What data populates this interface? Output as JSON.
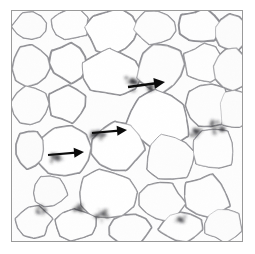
{
  "figure": {
    "kind": "histology-micrograph",
    "tissue": "adipose tissue",
    "stain_background": "#fdfdfd",
    "membrane_color": "#8d8d92",
    "membrane_dark_color": "#2f2f33",
    "frame_color": "#9a9a9a",
    "page_background": "#ffffff",
    "arrow_color": "#0b0b0b",
    "frame": {
      "x": 11,
      "y": 10,
      "width": 232,
      "height": 232
    }
  },
  "annotations": {
    "arrows": [
      {
        "name": "arrow-crown-structure-upper-right",
        "label": "",
        "direction": "right",
        "tail_x": 128,
        "tail_y": 87,
        "tip_x": 165,
        "tip_y": 82,
        "length": 38,
        "stroke_width": 2.4,
        "head_length": 11,
        "head_half_width": 5.5
      },
      {
        "name": "arrow-crown-structure-middle",
        "label": "",
        "direction": "right",
        "tail_x": 92,
        "tail_y": 133,
        "tip_x": 127,
        "tip_y": 130,
        "length": 35,
        "stroke_width": 2.2,
        "head_length": 10,
        "head_half_width": 5.0
      },
      {
        "name": "arrow-crown-structure-lower-left",
        "label": "",
        "direction": "right",
        "tail_x": 48,
        "tail_y": 155,
        "tip_x": 84,
        "tip_y": 152,
        "length": 36,
        "stroke_width": 2.2,
        "head_length": 10,
        "head_half_width": 5.0
      }
    ]
  },
  "chart_data": {
    "type": "scatter",
    "title": "",
    "xlabel": "",
    "ylabel": "",
    "xlim": [
      0,
      232
    ],
    "ylim": [
      0,
      232
    ],
    "grid": false,
    "legend": "none",
    "adipocytes": [
      {
        "id": "cell-1",
        "cx": 18,
        "cy": 16,
        "rx": 17,
        "ry": 14,
        "rot": -12,
        "tone": "#fcfcfc"
      },
      {
        "id": "cell-2",
        "cx": 58,
        "cy": 14,
        "rx": 20,
        "ry": 15,
        "rot": 8,
        "tone": "#fefefe"
      },
      {
        "id": "cell-3",
        "cx": 101,
        "cy": 20,
        "rx": 26,
        "ry": 22,
        "rot": -5,
        "tone": "#ffffff"
      },
      {
        "id": "cell-4",
        "cx": 146,
        "cy": 17,
        "rx": 21,
        "ry": 17,
        "rot": 14,
        "tone": "#fdfdfd"
      },
      {
        "id": "cell-5",
        "cx": 190,
        "cy": 15,
        "rx": 22,
        "ry": 16,
        "rot": -9,
        "tone": "#fefefe"
      },
      {
        "id": "cell-6",
        "cx": 221,
        "cy": 22,
        "rx": 18,
        "ry": 19,
        "rot": 6,
        "tone": "#fcfcfc"
      },
      {
        "id": "cell-7",
        "cx": 20,
        "cy": 55,
        "rx": 19,
        "ry": 20,
        "rot": 10,
        "tone": "#fdfdfd"
      },
      {
        "id": "cell-8",
        "cx": 57,
        "cy": 52,
        "rx": 18,
        "ry": 19,
        "rot": -14,
        "tone": "#fefefe"
      },
      {
        "id": "cell-9",
        "cx": 100,
        "cy": 62,
        "rx": 28,
        "ry": 24,
        "rot": 7,
        "tone": "#ffffff"
      },
      {
        "id": "cell-10",
        "cx": 150,
        "cy": 57,
        "rx": 24,
        "ry": 23,
        "rot": -6,
        "tone": "#fdfdfd"
      },
      {
        "id": "cell-11",
        "cx": 194,
        "cy": 52,
        "rx": 20,
        "ry": 18,
        "rot": 11,
        "tone": "#fefefe"
      },
      {
        "id": "cell-12",
        "cx": 222,
        "cy": 58,
        "rx": 17,
        "ry": 20,
        "rot": -8,
        "tone": "#fcfcfc"
      },
      {
        "id": "cell-13",
        "cx": 19,
        "cy": 96,
        "rx": 18,
        "ry": 19,
        "rot": -4,
        "tone": "#fdfdfd"
      },
      {
        "id": "cell-14",
        "cx": 56,
        "cy": 93,
        "rx": 19,
        "ry": 18,
        "rot": 13,
        "tone": "#fefefe"
      },
      {
        "id": "cell-15",
        "cx": 148,
        "cy": 108,
        "rx": 32,
        "ry": 28,
        "rot": 4,
        "tone": "#ffffff"
      },
      {
        "id": "cell-16",
        "cx": 198,
        "cy": 96,
        "rx": 21,
        "ry": 22,
        "rot": -11,
        "tone": "#fdfdfd"
      },
      {
        "id": "cell-17",
        "cx": 225,
        "cy": 100,
        "rx": 16,
        "ry": 19,
        "rot": 9,
        "tone": "#fcfcfc"
      },
      {
        "id": "cell-18",
        "cx": 52,
        "cy": 142,
        "rx": 28,
        "ry": 24,
        "rot": -7,
        "tone": "#ffffff"
      },
      {
        "id": "cell-19",
        "cx": 106,
        "cy": 138,
        "rx": 26,
        "ry": 24,
        "rot": 6,
        "tone": "#ffffff"
      },
      {
        "id": "cell-20",
        "cx": 160,
        "cy": 148,
        "rx": 24,
        "ry": 22,
        "rot": -10,
        "tone": "#fdfdfd"
      },
      {
        "id": "cell-21",
        "cx": 204,
        "cy": 140,
        "rx": 21,
        "ry": 20,
        "rot": 12,
        "tone": "#fefefe"
      },
      {
        "id": "cell-22",
        "cx": 18,
        "cy": 140,
        "rx": 14,
        "ry": 18,
        "rot": 5,
        "tone": "#fcfcfc"
      },
      {
        "id": "cell-23",
        "cx": 96,
        "cy": 186,
        "rx": 28,
        "ry": 24,
        "rot": -5,
        "tone": "#ffffff"
      },
      {
        "id": "cell-24",
        "cx": 150,
        "cy": 192,
        "rx": 22,
        "ry": 20,
        "rot": 8,
        "tone": "#fdfdfd"
      },
      {
        "id": "cell-25",
        "cx": 196,
        "cy": 188,
        "rx": 23,
        "ry": 21,
        "rot": -9,
        "tone": "#fefefe"
      },
      {
        "id": "cell-26",
        "cx": 38,
        "cy": 182,
        "rx": 17,
        "ry": 16,
        "rot": 14,
        "tone": "#fcfcfc"
      },
      {
        "id": "cell-27",
        "cx": 22,
        "cy": 212,
        "rx": 17,
        "ry": 15,
        "rot": -6,
        "tone": "#fdfdfd"
      },
      {
        "id": "cell-28",
        "cx": 64,
        "cy": 216,
        "rx": 21,
        "ry": 15,
        "rot": 7,
        "tone": "#fefefe"
      },
      {
        "id": "cell-29",
        "cx": 118,
        "cy": 220,
        "rx": 22,
        "ry": 16,
        "rot": -4,
        "tone": "#fdfdfd"
      },
      {
        "id": "cell-30",
        "cx": 170,
        "cy": 218,
        "rx": 20,
        "ry": 15,
        "rot": 10,
        "tone": "#fefefe"
      },
      {
        "id": "cell-31",
        "cx": 214,
        "cy": 216,
        "rx": 19,
        "ry": 16,
        "rot": -8,
        "tone": "#fcfcfc"
      }
    ],
    "crown_like_structures": [
      {
        "id": "cls-1",
        "cx": 122,
        "cy": 72,
        "r": 9,
        "intensity": 0.95
      },
      {
        "id": "cls-2",
        "cx": 86,
        "cy": 124,
        "r": 7,
        "intensity": 0.85
      },
      {
        "id": "cls-3",
        "cx": 44,
        "cy": 148,
        "r": 6,
        "intensity": 0.7
      },
      {
        "id": "cls-4",
        "cx": 206,
        "cy": 118,
        "r": 7,
        "intensity": 0.8
      },
      {
        "id": "cls-5",
        "cx": 186,
        "cy": 122,
        "r": 6,
        "intensity": 0.75
      },
      {
        "id": "cls-6",
        "cx": 92,
        "cy": 206,
        "r": 7,
        "intensity": 0.7
      },
      {
        "id": "cls-7",
        "cx": 68,
        "cy": 200,
        "r": 5,
        "intensity": 0.6
      },
      {
        "id": "cls-8",
        "cx": 140,
        "cy": 76,
        "r": 5,
        "intensity": 0.65
      },
      {
        "id": "cls-9",
        "cx": 170,
        "cy": 210,
        "r": 5,
        "intensity": 0.55
      },
      {
        "id": "cls-10",
        "cx": 30,
        "cy": 200,
        "r": 5,
        "intensity": 0.6
      }
    ]
  }
}
